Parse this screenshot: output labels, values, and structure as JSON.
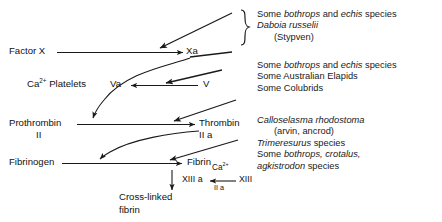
{
  "diagram": {
    "nodes": {
      "factor_x": "Factor X",
      "xa": "Xa",
      "ca_platelets_ca": "Ca",
      "ca_platelets_sup": "2+",
      "ca_platelets_rest": " Platelets",
      "va": "Va",
      "v": "V",
      "prothrombin": "Prothrombin",
      "prothrombin_sub": "II",
      "thrombin": "Thrombin",
      "thrombin_sub": "II a",
      "fibrinogen": "Fibrinogen",
      "fibrin": "Fibrin",
      "xiii_a": "XIII a",
      "xiii": "XIII",
      "xiii_cofactor_ca": "Ca",
      "xiii_cofactor_sup": "2+",
      "xiii_cofactor_iia": "II a",
      "crosslinked_line1": "Cross-linked",
      "crosslinked_line2": "fibrin"
    },
    "venom_groups": [
      {
        "id": "group-x-activators",
        "bracket": "curly",
        "lines": [
          {
            "segments": [
              {
                "text": "Some ",
                "italic": false
              },
              {
                "text": "bothrops",
                "italic": true
              },
              {
                "text": " and ",
                "italic": false
              },
              {
                "text": "echis",
                "italic": true
              },
              {
                "text": " species",
                "italic": false
              }
            ],
            "indent": false
          },
          {
            "segments": [
              {
                "text": "Daboia russelii",
                "italic": true
              }
            ],
            "indent": false
          },
          {
            "segments": [
              {
                "text": "(Stypven)",
                "italic": false
              }
            ],
            "indent": true
          }
        ]
      },
      {
        "id": "group-prothrombin-activators",
        "bracket": "none",
        "lines": [
          {
            "segments": [
              {
                "text": "Some ",
                "italic": false
              },
              {
                "text": "bothrops",
                "italic": true
              },
              {
                "text": " and ",
                "italic": false
              },
              {
                "text": "echis",
                "italic": true
              },
              {
                "text": " species",
                "italic": false
              }
            ],
            "indent": false
          },
          {
            "segments": [
              {
                "text": "Some Australian Elapids",
                "italic": false
              }
            ],
            "indent": false
          },
          {
            "segments": [
              {
                "text": "Some Colubrids",
                "italic": false
              }
            ],
            "indent": false
          }
        ]
      },
      {
        "id": "group-thrombin-like",
        "bracket": "none",
        "lines": [
          {
            "segments": [
              {
                "text": "Calloselasma rhodostoma",
                "italic": true
              }
            ],
            "indent": false
          },
          {
            "segments": [
              {
                "text": "(arvin, ancrod)",
                "italic": false
              }
            ],
            "indent": true
          },
          {
            "segments": [
              {
                "text": "Trimeresurus",
                "italic": true
              },
              {
                "text": " species",
                "italic": false
              }
            ],
            "indent": false
          },
          {
            "segments": [
              {
                "text": "Some ",
                "italic": false
              },
              {
                "text": "bothrops, crotalus,",
                "italic": true
              }
            ],
            "indent": false
          },
          {
            "segments": [
              {
                "text": "agkistrodon",
                "italic": true
              },
              {
                "text": " species",
                "italic": false
              }
            ],
            "indent": false
          }
        ]
      }
    ],
    "colors": {
      "ink": "#111111",
      "line": "#1a1a1a",
      "background": "#ffffff"
    }
  }
}
